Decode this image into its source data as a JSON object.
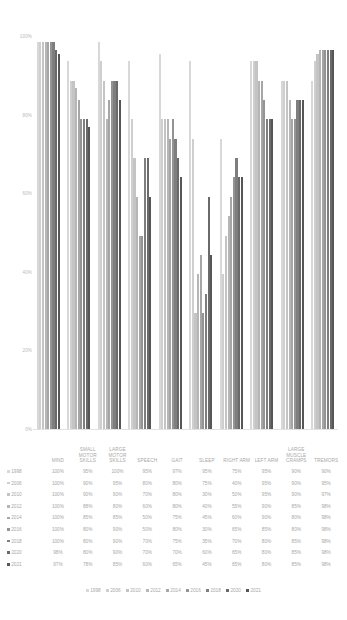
{
  "chart_data": {
    "type": "bar",
    "title": "",
    "subtitle": "",
    "xlabel": "",
    "ylabel": "",
    "ylim": [
      0,
      100
    ],
    "yticks": [
      "0%",
      "20%",
      "40%",
      "60%",
      "80%",
      "100%"
    ],
    "grid": false,
    "legend_position": "bottom",
    "categories": [
      "MIND",
      "SMALL MOTOR SKILLS",
      "LARGE MOTOR SKILLS",
      "SPEECH",
      "GAIT",
      "SLEEP",
      "RIGHT ARM",
      "LEFT ARM",
      "LARGE MUSCLE CRAMPS",
      "TREMORS"
    ],
    "series": [
      {
        "name": "1998",
        "color": "#d8d8d8",
        "values": [
          100,
          95,
          100,
          95,
          97,
          95,
          75,
          95,
          90,
          90
        ]
      },
      {
        "name": "2006",
        "color": "#cfcfcf",
        "values": [
          100,
          90,
          95,
          80,
          80,
          75,
          40,
          95,
          90,
          95
        ]
      },
      {
        "name": "2010",
        "color": "#c4c4c4",
        "values": [
          100,
          90,
          90,
          70,
          80,
          30,
          50,
          95,
          90,
          97
        ]
      },
      {
        "name": "2012",
        "color": "#b6b6b6",
        "values": [
          100,
          88,
          80,
          60,
          80,
          40,
          55,
          90,
          85,
          98
        ]
      },
      {
        "name": "2014",
        "color": "#a6a6a6",
        "values": [
          100,
          85,
          85,
          50,
          75,
          45,
          60,
          90,
          80,
          98
        ]
      },
      {
        "name": "2016",
        "color": "#949494",
        "values": [
          100,
          80,
          90,
          50,
          80,
          30,
          65,
          85,
          80,
          98
        ]
      },
      {
        "name": "2018",
        "color": "#7e7e7e",
        "values": [
          100,
          80,
          90,
          70,
          75,
          35,
          70,
          80,
          85,
          98
        ]
      },
      {
        "name": "2020",
        "color": "#6a6a6a",
        "values": [
          98,
          80,
          90,
          70,
          70,
          60,
          65,
          80,
          85,
          98
        ]
      },
      {
        "name": "2021",
        "color": "#565656",
        "values": [
          97,
          78,
          85,
          60,
          65,
          45,
          65,
          80,
          85,
          98
        ]
      }
    ]
  },
  "table": {
    "corner_label": "",
    "headers": [
      "MIND",
      "SMALL MOTOR SKILLS",
      "LARGE MOTOR SKILLS",
      "SPEECH",
      "GAIT",
      "SLEEP",
      "RIGHT ARM",
      "LEFT ARM",
      "LARGE MUSCLE CRAMPS",
      "TREMORS"
    ],
    "rows": [
      {
        "year": "1998",
        "color": "#d8d8d8",
        "cells": [
          "100%",
          "95%",
          "100%",
          "95%",
          "97%",
          "95%",
          "75%",
          "95%",
          "90%",
          "90%"
        ]
      },
      {
        "year": "2006",
        "color": "#cfcfcf",
        "cells": [
          "100%",
          "90%",
          "95%",
          "80%",
          "80%",
          "75%",
          "40%",
          "95%",
          "90%",
          "95%"
        ]
      },
      {
        "year": "2010",
        "color": "#c4c4c4",
        "cells": [
          "100%",
          "90%",
          "90%",
          "70%",
          "80%",
          "30%",
          "50%",
          "95%",
          "90%",
          "97%"
        ]
      },
      {
        "year": "2012",
        "color": "#b6b6b6",
        "cells": [
          "100%",
          "88%",
          "80%",
          "60%",
          "80%",
          "40%",
          "55%",
          "90%",
          "85%",
          "98%"
        ]
      },
      {
        "year": "2014",
        "color": "#a6a6a6",
        "cells": [
          "100%",
          "85%",
          "85%",
          "50%",
          "75%",
          "45%",
          "60%",
          "90%",
          "80%",
          "98%"
        ]
      },
      {
        "year": "2016",
        "color": "#949494",
        "cells": [
          "100%",
          "80%",
          "90%",
          "50%",
          "80%",
          "30%",
          "65%",
          "85%",
          "80%",
          "98%"
        ]
      },
      {
        "year": "2018",
        "color": "#7e7e7e",
        "cells": [
          "100%",
          "80%",
          "90%",
          "70%",
          "75%",
          "35%",
          "70%",
          "80%",
          "85%",
          "98%"
        ]
      },
      {
        "year": "2020",
        "color": "#6a6a6a",
        "cells": [
          "98%",
          "80%",
          "90%",
          "70%",
          "70%",
          "60%",
          "65%",
          "80%",
          "85%",
          "98%"
        ]
      },
      {
        "year": "2021",
        "color": "#565656",
        "cells": [
          "97%",
          "78%",
          "85%",
          "60%",
          "65%",
          "45%",
          "65%",
          "80%",
          "85%",
          "98%"
        ]
      }
    ]
  },
  "legend": {
    "items": [
      {
        "label": "1998",
        "color": "#d8d8d8"
      },
      {
        "label": "2006",
        "color": "#cfcfcf"
      },
      {
        "label": "2010",
        "color": "#c4c4c4"
      },
      {
        "label": "2012",
        "color": "#b6b6b6"
      },
      {
        "label": "2014",
        "color": "#a6a6a6"
      },
      {
        "label": "2016",
        "color": "#949494"
      },
      {
        "label": "2018",
        "color": "#7e7e7e"
      },
      {
        "label": "2020",
        "color": "#6a6a6a"
      },
      {
        "label": "2021",
        "color": "#565656"
      }
    ]
  }
}
